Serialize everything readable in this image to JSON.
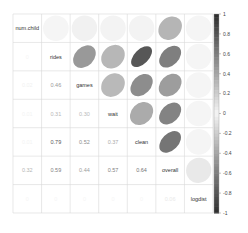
{
  "chart_data": {
    "type": "heatmap",
    "style": "corrplot-mixed",
    "title": "",
    "variables": [
      "num.child",
      "rides",
      "games",
      "wait",
      "clean",
      "overall",
      "logdist"
    ],
    "matrix": [
      [
        1.0,
        0.0,
        0.02,
        0.01,
        0.01,
        0.32,
        0.0
      ],
      [
        0.0,
        1.0,
        0.46,
        0.31,
        0.79,
        0.59,
        0.0
      ],
      [
        0.02,
        0.46,
        1.0,
        0.3,
        0.52,
        0.44,
        0.0
      ],
      [
        0.01,
        0.31,
        0.3,
        1.0,
        0.37,
        0.57,
        0.0
      ],
      [
        0.01,
        0.79,
        0.52,
        0.37,
        1.0,
        0.64,
        0.0
      ],
      [
        0.32,
        0.59,
        0.44,
        0.57,
        0.64,
        1.0,
        0.06
      ],
      [
        0.0,
        0.0,
        0.0,
        0.0,
        0.0,
        0.06,
        1.0
      ]
    ],
    "lower": "number",
    "upper": "ellipse",
    "colorbar": {
      "range": [
        -1,
        1
      ],
      "ticks": [
        "1",
        "0.8",
        "0.6",
        "0.4",
        "0.2",
        "0",
        "-0.2",
        "-0.4",
        "-0.6",
        "-0.8",
        "-1"
      ],
      "placement": "right",
      "palette": "grayscale-diverging"
    },
    "colors": {
      "high": "#2b2b2b",
      "mid": "#f5f5f5",
      "low": "#2b2b2b",
      "grid": "#d9d9d9"
    }
  }
}
